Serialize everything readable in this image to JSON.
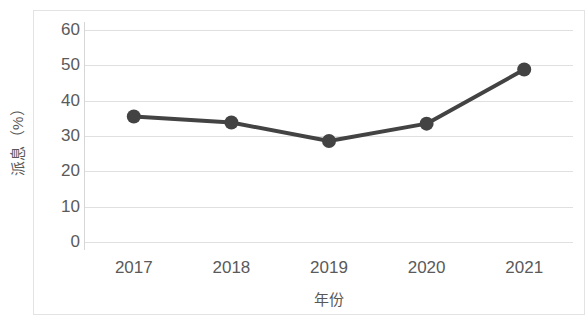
{
  "chart_data": {
    "type": "line",
    "title": "",
    "xlabel": "年份",
    "ylabel": "派息（%）",
    "categories": [
      "2017",
      "2018",
      "2019",
      "2020",
      "2021"
    ],
    "values": [
      35.5,
      33.8,
      28.6,
      33.5,
      48.8
    ],
    "series": [
      {
        "name": "派息",
        "values": [
          35.5,
          33.8,
          28.6,
          33.5,
          48.8
        ]
      }
    ],
    "x_tick_labels": [
      "2017",
      "2018",
      "2019",
      "2020",
      "2021"
    ],
    "y_tick_labels": [
      "0",
      "10",
      "20",
      "30",
      "40",
      "50",
      "60"
    ],
    "y_ticks": [
      0,
      10,
      20,
      30,
      40,
      50,
      60
    ],
    "ylim": [
      0,
      60
    ],
    "grid": "horizontal",
    "legend": "none",
    "marker": "circle",
    "line_color": "#434343",
    "marker_color": "#434343",
    "gridline_color": "#e0e0e0",
    "axis_text_color": "#5a5a5a",
    "background_color": "#ffffff"
  }
}
